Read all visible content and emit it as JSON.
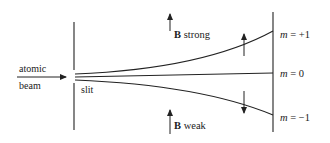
{
  "diagram": {
    "type": "stern-gerlach-schematic",
    "labels": {
      "beam_line1": "atomic",
      "beam_line2": "beam",
      "slit": "slit",
      "b_strong_B": "B",
      "b_strong_text": " strong",
      "b_weak_B": "B",
      "b_weak_text": " weak",
      "m_plus": "m = +1",
      "m_zero": "m = 0",
      "m_minus": "m = −1"
    },
    "m_states": [
      {
        "m_var": "m",
        "eq": " = +1"
      },
      {
        "m_var": "m",
        "eq": " = 0"
      },
      {
        "m_var": "m",
        "eq": " = −1"
      }
    ],
    "colors": {
      "ink": "#222222",
      "background": "#ffffff"
    }
  }
}
